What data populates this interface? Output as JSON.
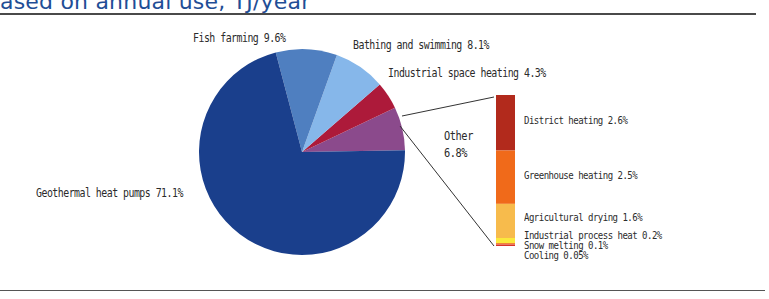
{
  "header": {
    "title": "ased on annual use, TJ/year"
  },
  "chart_data": {
    "type": "pie",
    "center": [
      302,
      152
    ],
    "radius": 103,
    "slices": [
      {
        "label": "Geothermal heat pumps",
        "value": 71.1,
        "display": "Geothermal heat pumps 71.1%",
        "color": "#1a3f8c"
      },
      {
        "label": "Fish farming",
        "value": 9.6,
        "display": "Fish farming 9.6%",
        "color": "#4f7fc0"
      },
      {
        "label": "Bathing and swimming",
        "value": 8.1,
        "display": "Bathing and swimming 8.1%",
        "color": "#86b7ea"
      },
      {
        "label": "Industrial space heating",
        "value": 4.3,
        "display": "Industrial space heating 4.3%",
        "color": "#ad1a3a"
      },
      {
        "label": "Other",
        "value": 6.8,
        "display_line1": "Other",
        "display_line2": "6.8%",
        "color": "#8b4a8c"
      }
    ],
    "other_breakdown": {
      "type": "stacked_bar",
      "total": 6.8,
      "segments": [
        {
          "label": "District heating",
          "value": 2.6,
          "display": "District heating 2.6%",
          "color": "#b22a1c"
        },
        {
          "label": "Greenhouse heating",
          "value": 2.5,
          "display": "Greenhouse heating 2.5%",
          "color": "#f06a1a"
        },
        {
          "label": "Agricultural drying",
          "value": 1.6,
          "display": "Agricultural drying 1.6%",
          "color": "#f7bb4c"
        },
        {
          "label": "Industrial process heat",
          "value": 0.2,
          "display": "Industrial process heat 0.2%",
          "color": "#fbe93c"
        },
        {
          "label": "Snow melting",
          "value": 0.1,
          "display": "Snow melting 0.1%",
          "color": "#f2823a"
        },
        {
          "label": "Cooling",
          "value": 0.05,
          "display": "Cooling 0.05%",
          "color": "#d8322a"
        }
      ]
    },
    "legend_position": "none (direct labels)",
    "grid": false
  }
}
